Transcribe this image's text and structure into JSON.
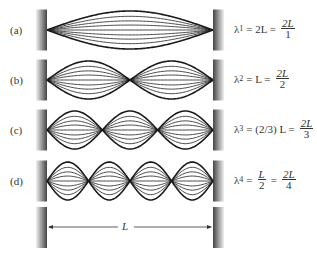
{
  "figure": {
    "length_label": "L",
    "walls": {
      "left_x": 36,
      "right_x": 213,
      "width": 11
    },
    "rows": [
      {
        "label": "(a)",
        "n": 1,
        "center_y": 30,
        "lambda_sym": "λ",
        "sub": "1",
        "middle": "= 2L =",
        "num": "2L",
        "den": "1"
      },
      {
        "label": "(b)",
        "n": 2,
        "center_y": 80,
        "lambda_sym": "λ",
        "sub": "2",
        "middle": "= L =",
        "num": "2L",
        "den": "2"
      },
      {
        "label": "(c)",
        "n": 3,
        "center_y": 130,
        "lambda_sym": "λ",
        "sub": "3",
        "middle": "= (2/3) L =",
        "num": "2L",
        "den": "3"
      },
      {
        "label": "(d)",
        "n": 4,
        "center_y": 181,
        "lambda_sym": "λ",
        "sub": "4",
        "middle_num": "L",
        "middle_den": "2",
        "num": "2L",
        "den": "4"
      }
    ],
    "caption_fragment": "...ll ...  ...ll ...  ... ... ... ... ... ...ll... ..."
  },
  "colors": {
    "string": "#1a1a1a",
    "wall_dark": "#4a4a4a",
    "wall_light": "#e6e6e6",
    "text": "#333333"
  }
}
